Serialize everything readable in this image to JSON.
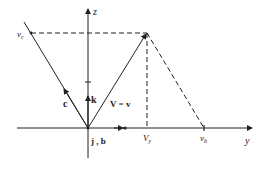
{
  "diagram": {
    "type": "vector-velocity-diagram",
    "axes": {
      "z_label": "z",
      "y_label": "y"
    },
    "labels": {
      "v_c": "v",
      "v_c_sub": "c",
      "c_vector": "c",
      "k_vector": "k",
      "V_eq_v": "V = v",
      "j_b": "j , b",
      "V_y": "V",
      "V_y_sub": "y",
      "v_b": "v",
      "v_b_sub": "b"
    },
    "colors": {
      "line": "#222222",
      "background": "#ffffff"
    }
  }
}
